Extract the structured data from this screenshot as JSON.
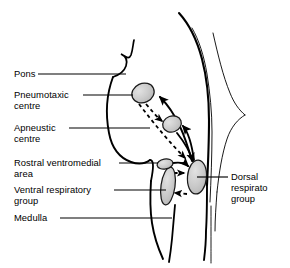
{
  "figure": {
    "kind": "anatomical-diagram",
    "background_color": "#ffffff",
    "outline_color": "#000000",
    "nucleus_fill_color": "#c8c8c8",
    "nucleus_stroke_color": "#1a1a1a",
    "leader_line_color": "#000000",
    "arrow_solid_color": "#000000",
    "arrow_dashed_color": "#000000"
  },
  "labels": {
    "pons": "Pons",
    "pneumotaxic_line1": "Pneumotaxic",
    "pneumotaxic_line2": "centre",
    "apneustic_line1": "Apneustic",
    "apneustic_line2": "centre",
    "rostral_line1": "Rostral ventromedial",
    "rostral_line2": "area",
    "ventral_line1": "Ventral respiratory",
    "ventral_line2": "group",
    "medulla": "Medulla",
    "dorsal_line1": "Dorsal",
    "dorsal_line2": "respirato",
    "dorsal_line3": "group"
  },
  "structures": [
    {
      "name": "pneumotaxic-centre",
      "label": "Pneumotaxic centre",
      "shape": "ellipse",
      "cx": 143,
      "cy": 93,
      "rx": 11.5,
      "ry": 9.5,
      "rotation": -25
    },
    {
      "name": "apneustic-centre",
      "label": "Apneustic centre",
      "shape": "ellipse",
      "cx": 172,
      "cy": 124,
      "rx": 9.5,
      "ry": 8,
      "rotation": -20
    },
    {
      "name": "rostral-ventromedial-area",
      "label": "Rostral ventromedial area",
      "shape": "ellipse",
      "cx": 165,
      "cy": 164,
      "rx": 8,
      "ry": 5,
      "rotation": -10
    },
    {
      "name": "ventral-respiratory-group",
      "label": "Ventral respiratory group",
      "shape": "ellipse",
      "cx": 168,
      "cy": 186,
      "rx": 7,
      "ry": 19,
      "rotation": 8
    },
    {
      "name": "dorsal-respiratory-group",
      "label": "Dorsal respiratory group",
      "shape": "ellipse",
      "cx": 197,
      "cy": 177,
      "rx": 9.5,
      "ry": 17,
      "rotation": 5
    }
  ],
  "connections": [
    {
      "name": "dorsal-to-pneumotaxic",
      "style": "solid",
      "from": "dorsal-respiratory-group",
      "to": "pneumotaxic-centre"
    },
    {
      "name": "dorsal-to-apneustic",
      "style": "solid",
      "from": "dorsal-respiratory-group",
      "to": "apneustic-centre"
    },
    {
      "name": "apneustic-to-dorsal",
      "style": "solid",
      "from": "apneustic-centre",
      "to": "dorsal-respiratory-group"
    },
    {
      "name": "pneumotaxic-to-apneustic",
      "style": "dashed",
      "from": "pneumotaxic-centre",
      "to": "apneustic-centre"
    },
    {
      "name": "pneumotaxic-to-dorsal",
      "style": "dashed",
      "from": "pneumotaxic-centre",
      "to": "dorsal-respiratory-group"
    },
    {
      "name": "rostral-to-dorsal",
      "style": "dashed",
      "from": "rostral-ventromedial-area",
      "to": "dorsal-respiratory-group"
    },
    {
      "name": "dorsal-to-ventral",
      "style": "dashed",
      "from": "dorsal-respiratory-group",
      "to": "ventral-respiratory-group"
    }
  ],
  "leader_lines": [
    {
      "name": "leader-pons",
      "x1": 38,
      "y1": 74,
      "x2": 126,
      "y2": 74
    },
    {
      "name": "leader-pneumotaxic",
      "x1": 83,
      "y1": 95,
      "x2": 133,
      "y2": 95
    },
    {
      "name": "leader-apneustic",
      "x1": 69,
      "y1": 128,
      "x2": 148,
      "y2": 128
    },
    {
      "name": "leader-rostral",
      "x1": 119,
      "y1": 163,
      "x2": 158,
      "y2": 163
    },
    {
      "name": "leader-ventral",
      "x1": 114,
      "y1": 190,
      "x2": 166,
      "y2": 190
    },
    {
      "name": "leader-medulla",
      "x1": 60,
      "y1": 218,
      "x2": 172,
      "y2": 218
    },
    {
      "name": "leader-dorsal",
      "x1": 197,
      "y1": 177,
      "x2": 227,
      "y2": 177
    }
  ]
}
